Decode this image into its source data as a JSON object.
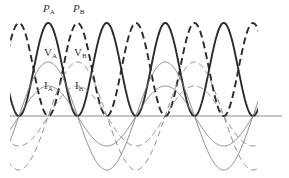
{
  "diagram": {
    "type": "ac-power-waveforms",
    "baseline": {
      "y": 116,
      "x_start": 10,
      "x_end": 282,
      "color": "#8a8a8a"
    },
    "geometry": {
      "origin_x": 19,
      "period_px": 117,
      "clip_x_min": 10,
      "clip_x_max": 258
    },
    "series": [
      {
        "id": "PA",
        "name": "P_A",
        "kind": "power",
        "style": "solid",
        "weight": "thick",
        "amplitude_px": 93,
        "phase": 0,
        "color": "#2a2a2a"
      },
      {
        "id": "PB",
        "name": "P_B",
        "kind": "power",
        "style": "dashed",
        "weight": "thick",
        "amplitude_px": 93,
        "phase": 0.25,
        "color": "#2a2a2a"
      },
      {
        "id": "VA",
        "name": "V_A",
        "kind": "voltage",
        "style": "solid",
        "weight": "thin",
        "amplitude_px": 54,
        "phase": 0,
        "color": "#7a7a7a"
      },
      {
        "id": "VB",
        "name": "V_B",
        "kind": "voltage",
        "style": "dashed",
        "weight": "thin",
        "amplitude_px": 54,
        "phase": 0.25,
        "color": "#7a7a7a"
      },
      {
        "id": "IA",
        "name": "I_A",
        "kind": "current",
        "style": "solid",
        "weight": "thin",
        "amplitude_px": 30,
        "phase": 0,
        "color": "#7a7a7a"
      },
      {
        "id": "IB",
        "name": "I_B",
        "kind": "current",
        "style": "dashed",
        "weight": "thin",
        "amplitude_px": 30,
        "phase": 0.25,
        "color": "#7a7a7a"
      }
    ],
    "labels": [
      {
        "id": "label-PA",
        "letter": "P",
        "sub": "A",
        "italic": true,
        "x": 43,
        "y": 3
      },
      {
        "id": "label-PB",
        "letter": "P",
        "sub": "B",
        "italic": true,
        "x": 73,
        "y": 3
      },
      {
        "id": "label-VA",
        "letter": "V",
        "sub": "A",
        "italic": false,
        "x": 44,
        "y": 47
      },
      {
        "id": "label-VB",
        "letter": "V",
        "sub": "B",
        "italic": false,
        "x": 74,
        "y": 47
      },
      {
        "id": "label-IA",
        "letter": "I",
        "sub": "A",
        "italic": false,
        "x": 44,
        "y": 80
      },
      {
        "id": "label-IB",
        "letter": "I",
        "sub": "B",
        "italic": false,
        "x": 75,
        "y": 80
      }
    ]
  }
}
